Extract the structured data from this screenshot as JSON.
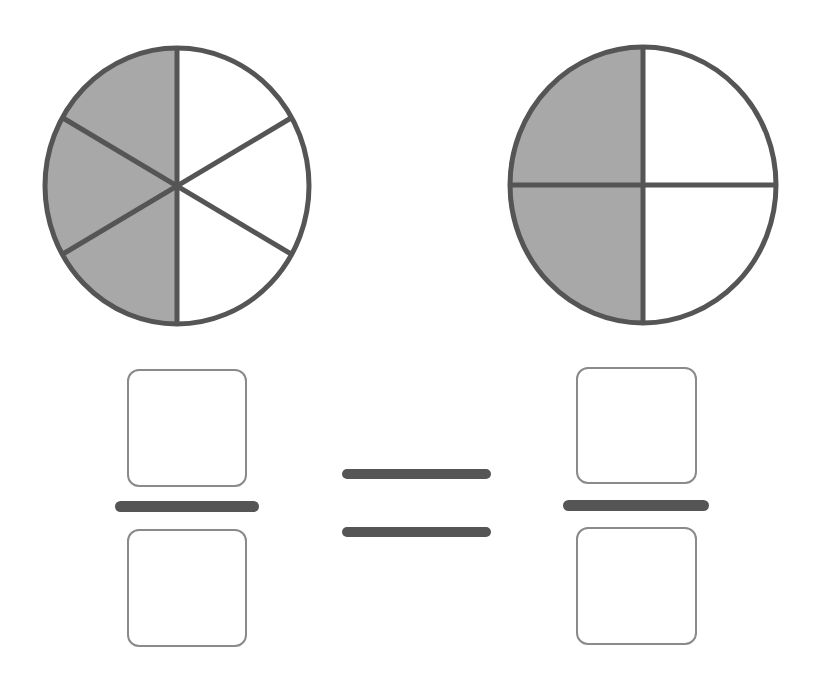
{
  "diagram": {
    "type": "equivalent-fractions-worksheet",
    "colors": {
      "shaded": "#a8a8a8",
      "unshaded": "#ffffff",
      "stroke": "#555555",
      "box_border": "#8a8a8a"
    },
    "left_circle": {
      "parts": 6,
      "shaded_parts": 3,
      "shaded_fraction": "3/6"
    },
    "right_circle": {
      "parts": 4,
      "shaded_parts": 2,
      "shaded_fraction": "2/4"
    },
    "left_fraction": {
      "numerator": "",
      "denominator": ""
    },
    "right_fraction": {
      "numerator": "",
      "denominator": ""
    },
    "operator": "="
  }
}
